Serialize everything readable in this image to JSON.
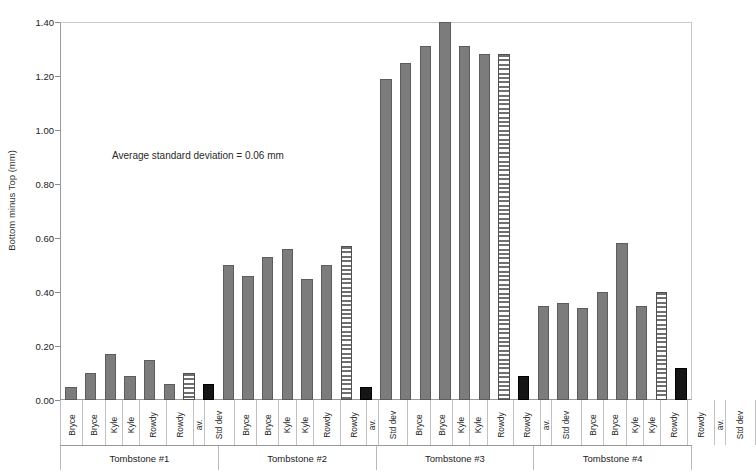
{
  "chart_data": {
    "type": "bar",
    "title": "",
    "xlabel": "",
    "ylabel": "Bottom minus Top (mm)",
    "ylim": [
      0.0,
      1.4
    ],
    "ytick_labels": [
      "1.40",
      "1.20",
      "1.00",
      "0.80",
      "0.60",
      "0.40",
      "0.20",
      "0.00"
    ],
    "ytick_values": [
      1.4,
      1.2,
      1.0,
      0.8,
      0.6,
      0.4,
      0.2,
      0.0
    ],
    "grid": false,
    "legend": "none",
    "annotation": "Average standard deviation = 0.06 mm",
    "categories": [
      "Bryce",
      "Bryce",
      "Kyle",
      "Kyle",
      "Rowdy",
      "Rowdy",
      "av.",
      "Std dev"
    ],
    "groups": [
      {
        "label": "Tombstone #1",
        "bars": [
          {
            "category": "Bryce",
            "value": 0.05,
            "style": "solid"
          },
          {
            "category": "Bryce",
            "value": 0.1,
            "style": "solid"
          },
          {
            "category": "Kyle",
            "value": 0.17,
            "style": "solid"
          },
          {
            "category": "Kyle",
            "value": 0.09,
            "style": "solid"
          },
          {
            "category": "Rowdy",
            "value": 0.15,
            "style": "solid"
          },
          {
            "category": "Rowdy",
            "value": 0.06,
            "style": "solid"
          },
          {
            "category": "av.",
            "value": 0.1,
            "style": "striped"
          },
          {
            "category": "Std dev",
            "value": 0.06,
            "style": "black"
          }
        ]
      },
      {
        "label": "Tombstone #2",
        "bars": [
          {
            "category": "Bryce",
            "value": 0.5,
            "style": "solid"
          },
          {
            "category": "Bryce",
            "value": 0.46,
            "style": "solid"
          },
          {
            "category": "Kyle",
            "value": 0.53,
            "style": "solid"
          },
          {
            "category": "Kyle",
            "value": 0.56,
            "style": "solid"
          },
          {
            "category": "Rowdy",
            "value": 0.45,
            "style": "solid"
          },
          {
            "category": "Rowdy",
            "value": 0.5,
            "style": "solid"
          },
          {
            "category": "av.",
            "value": 0.57,
            "style": "striped"
          },
          {
            "category": "Std dev",
            "value": 0.05,
            "style": "black"
          }
        ]
      },
      {
        "label": "Tombstone #3",
        "bars": [
          {
            "category": "Bryce",
            "value": 1.19,
            "style": "solid"
          },
          {
            "category": "Bryce",
            "value": 1.25,
            "style": "solid"
          },
          {
            "category": "Kyle",
            "value": 1.31,
            "style": "solid"
          },
          {
            "category": "Kyle",
            "value": 1.4,
            "style": "solid"
          },
          {
            "category": "Rowdy",
            "value": 1.31,
            "style": "solid"
          },
          {
            "category": "Rowdy",
            "value": 1.28,
            "style": "solid"
          },
          {
            "category": "av.",
            "value": 1.28,
            "style": "striped"
          },
          {
            "category": "Std dev",
            "value": 0.09,
            "style": "black"
          }
        ]
      },
      {
        "label": "Tombstone #4",
        "bars": [
          {
            "category": "Bryce",
            "value": 0.35,
            "style": "solid"
          },
          {
            "category": "Bryce",
            "value": 0.36,
            "style": "solid"
          },
          {
            "category": "Kyle",
            "value": 0.34,
            "style": "solid"
          },
          {
            "category": "Kyle",
            "value": 0.4,
            "style": "solid"
          },
          {
            "category": "Rowdy",
            "value": 0.58,
            "style": "solid"
          },
          {
            "category": "Rowdy",
            "value": 0.35,
            "style": "solid"
          },
          {
            "category": "av.",
            "value": 0.4,
            "style": "striped"
          },
          {
            "category": "Std dev",
            "value": 0.12,
            "style": "black"
          }
        ]
      }
    ],
    "colors": {
      "bar_fill": "#7c7c7c",
      "bar_edge": "#5c5c5c",
      "avg_fill": "#ffffff",
      "std_fill": "#151515",
      "axis": "#9a9a9a",
      "text": "#1d1d1d"
    }
  }
}
